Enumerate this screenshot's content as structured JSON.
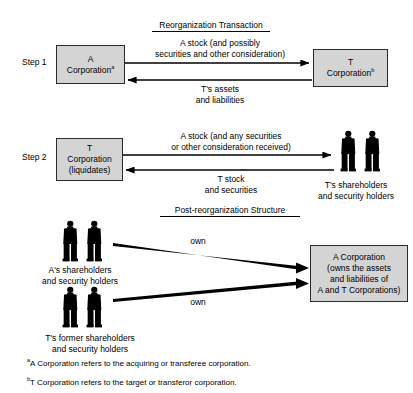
{
  "document": {
    "title": "Reorganization Transaction and Post-reorganization Structure Diagram"
  },
  "sections": {
    "reorg": {
      "heading": "Reorganization Transaction",
      "step1": {
        "label": "Step 1",
        "left_box": {
          "line1": "A",
          "line2": "Corporation",
          "footnote_marker": "a"
        },
        "right_box": {
          "line1": "T",
          "line2": "Corporation",
          "footnote_marker": "b"
        },
        "arrow_top_label": {
          "line1": "A stock (and possibly",
          "line2": "securities and other consideration)"
        },
        "arrow_bottom_label": {
          "line1": "T's assets",
          "line2": "and liabilities"
        }
      },
      "step2": {
        "label": "Step 2",
        "left_box": {
          "line1": "T",
          "line2": "Corporation",
          "line3": "(liquidates)"
        },
        "arrow_top_label": {
          "line1": "A stock (and any securities",
          "line2": "or other consideration received)"
        },
        "arrow_bottom_label": {
          "line1": "T stock",
          "line2": "and securities"
        },
        "people_caption": {
          "line1": "T's shareholders",
          "line2": "and security holders"
        }
      }
    },
    "post_reorg": {
      "heading": "Post-reorganization Structure",
      "group_a": {
        "caption_line1": "A's shareholders",
        "caption_line2": "and security holders",
        "arrow_label": "own"
      },
      "group_t": {
        "caption_line1": "T's former shareholders",
        "caption_line2": "and security holders",
        "arrow_label": "own"
      },
      "corp_box": {
        "line1": "A Corporation",
        "line2": "(owns the assets",
        "line3": "and liabilities of",
        "line4": "A and T Corporations)"
      }
    }
  },
  "footnotes": [
    {
      "marker": "a",
      "text": "A Corporation refers to the acquiring or transferee corporation."
    },
    {
      "marker": "b",
      "text": "T Corporation refers to the target or transferor corporation."
    }
  ],
  "colors": {
    "box_fill": "#d4d4d4",
    "box_border": "#2a2a2a",
    "ink": "#000000",
    "page_background": "#ffffff"
  },
  "icons": {
    "person": "person-silhouette-icon",
    "arrow_right": "arrow-right-icon",
    "arrow_left": "arrow-left-icon"
  }
}
